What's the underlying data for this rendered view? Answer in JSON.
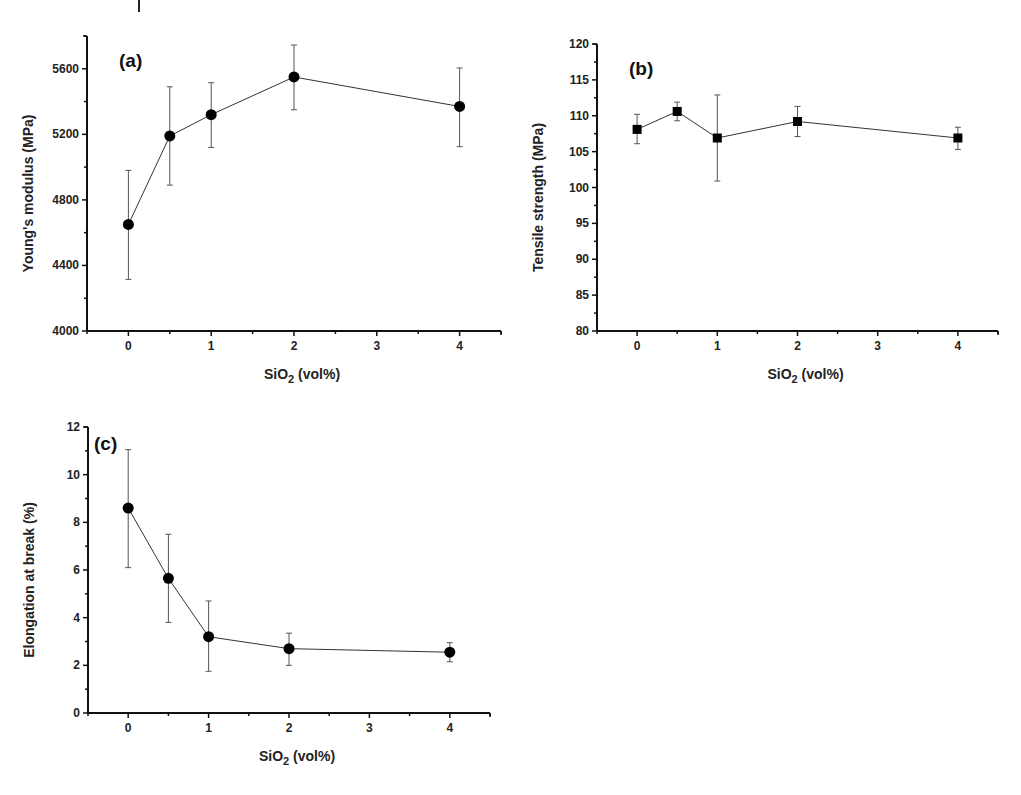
{
  "figure": {
    "panels": [
      "(a)",
      "(b)",
      "(c)"
    ]
  },
  "chart_data": [
    {
      "id": "a",
      "type": "line",
      "panel_label": "(a)",
      "title": "",
      "xlabel": "SiO2 (vol%)",
      "ylabel": "Young's modulus (MPa)",
      "xlim": [
        -0.5,
        4.5
      ],
      "ylim": [
        4000,
        5800
      ],
      "xticks": [
        0,
        1,
        2,
        3,
        4
      ],
      "yticks": [
        4000,
        4400,
        4800,
        5200,
        5600
      ],
      "marker": "circle",
      "grid": false,
      "x": [
        0,
        0.5,
        1,
        2,
        4
      ],
      "series": [
        {
          "name": "Young's modulus",
          "values": [
            4650,
            5190,
            5320,
            5550,
            5370
          ],
          "error_low": [
            4315,
            4890,
            5120,
            5350,
            5125
          ],
          "error_high": [
            4980,
            5490,
            5515,
            5745,
            5605
          ]
        }
      ],
      "frame": {
        "left": 87,
        "right": 501,
        "top": 36,
        "bottom": 331
      }
    },
    {
      "id": "b",
      "type": "line",
      "panel_label": "(b)",
      "title": "",
      "xlabel": "SiO2 (vol%)",
      "ylabel": "Tensile strength (MPa)",
      "xlim": [
        -0.5,
        4.5
      ],
      "ylim": [
        80,
        120
      ],
      "xticks": [
        0,
        1,
        2,
        3,
        4
      ],
      "yticks": [
        80,
        85,
        90,
        95,
        100,
        105,
        110,
        115,
        120
      ],
      "marker": "square",
      "grid": false,
      "x": [
        0,
        0.5,
        1,
        2,
        4
      ],
      "series": [
        {
          "name": "Tensile strength",
          "values": [
            108.1,
            110.6,
            106.9,
            109.2,
            106.9
          ],
          "error_low": [
            106.1,
            109.3,
            100.9,
            107.1,
            105.3
          ],
          "error_high": [
            110.2,
            111.9,
            112.9,
            111.3,
            108.4
          ]
        }
      ],
      "frame": {
        "left": 597,
        "right": 998,
        "top": 44,
        "bottom": 331
      }
    },
    {
      "id": "c",
      "type": "line",
      "panel_label": "(c)",
      "title": "",
      "xlabel": "SiO2 (vol%)",
      "ylabel": "Elongation at break (%)",
      "xlim": [
        -0.5,
        4.5
      ],
      "ylim": [
        0,
        12
      ],
      "xticks": [
        0,
        1,
        2,
        3,
        4
      ],
      "yticks": [
        0,
        2,
        4,
        6,
        8,
        10,
        12
      ],
      "marker": "circle",
      "grid": false,
      "x": [
        0,
        0.5,
        1,
        2,
        4
      ],
      "series": [
        {
          "name": "Elongation at break",
          "values": [
            8.6,
            5.65,
            3.2,
            2.7,
            2.55
          ],
          "error_low": [
            6.1,
            3.8,
            1.75,
            2.0,
            2.15
          ],
          "error_high": [
            11.05,
            7.5,
            4.7,
            3.35,
            2.95
          ]
        }
      ],
      "frame": {
        "left": 88,
        "right": 490,
        "top": 427,
        "bottom": 713
      }
    }
  ]
}
